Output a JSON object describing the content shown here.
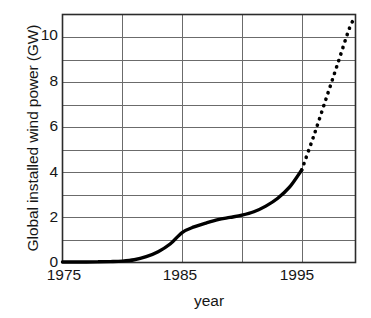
{
  "chart_data": {
    "type": "line",
    "title": "",
    "xlabel": "year",
    "ylabel": "Global installed wind power (GW)",
    "xlim": [
      1975,
      1999.5
    ],
    "ylim": [
      0,
      11
    ],
    "xticks": [
      1975,
      1985,
      1995
    ],
    "xtick_labels": [
      "1975",
      "1985",
      "1995"
    ],
    "yticks": [
      0,
      2,
      4,
      6,
      8,
      10
    ],
    "ytick_labels": [
      "0",
      "2",
      "4",
      "6",
      "8",
      "10"
    ],
    "grid": {
      "horizontal": [
        0,
        1,
        2,
        3,
        4,
        5,
        6,
        7,
        8,
        9,
        10
      ],
      "vertical": [
        1980,
        1985,
        1990,
        1995
      ],
      "color": "#6b6b6b"
    },
    "legend": null,
    "series": [
      {
        "name": "Historical installed capacity",
        "style": "solid",
        "color": "#000000",
        "x": [
          1975,
          1976,
          1977,
          1978,
          1979,
          1980,
          1981,
          1982,
          1983,
          1984,
          1985,
          1986,
          1987,
          1988,
          1989,
          1990,
          1991,
          1992,
          1993,
          1994,
          1995
        ],
        "y": [
          0.02,
          0.02,
          0.02,
          0.03,
          0.04,
          0.06,
          0.12,
          0.26,
          0.48,
          0.82,
          1.33,
          1.58,
          1.75,
          1.9,
          2.0,
          2.1,
          2.25,
          2.5,
          2.85,
          3.35,
          4.1
        ]
      },
      {
        "name": "Projected installed capacity",
        "style": "dotted",
        "color": "#000000",
        "x": [
          1995,
          1996,
          1997,
          1998,
          1999,
          1999.5
        ],
        "y": [
          4.1,
          5.6,
          7.2,
          8.8,
          10.4,
          10.9
        ]
      }
    ],
    "annotations": []
  },
  "axes": {
    "y_label": "Global installed wind power (GW)",
    "x_label": "year"
  }
}
